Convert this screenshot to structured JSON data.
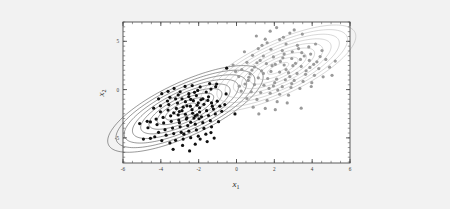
{
  "figure": {
    "background_color": "#f2f2f2",
    "plot_background_color": "#ffffff",
    "frame_color": "#4a4a4a"
  },
  "chart_data": {
    "type": "scatter",
    "title": "",
    "subtitle": "",
    "xlabel": "x",
    "xlabel_sub": "1",
    "ylabel": "x",
    "ylabel_sub": "2",
    "xlim": [
      -6,
      6
    ],
    "ylim": [
      -7.6,
      7.0
    ],
    "xticks": [
      -6,
      -4,
      -2,
      0,
      2,
      4,
      6
    ],
    "xtick_labels": [
      "-6",
      "-4",
      "-2",
      "0",
      "2",
      "4",
      "6"
    ],
    "yticks": [
      -5,
      0,
      5
    ],
    "ytick_labels": [
      "-5",
      "0",
      "5"
    ],
    "x_minor_tick_step": 0.5,
    "y_minor_tick_step": 0.5,
    "grid": false,
    "legend": "none",
    "series": [
      {
        "name": "cluster-1",
        "color": "#101010",
        "marker": "dot",
        "marker_size": 1.6,
        "mean": [
          -2.7,
          -2.0
        ],
        "cov": [
          [
            1.55,
            1.25
          ],
          [
            1.25,
            1.85
          ]
        ],
        "n_points": 120,
        "contour_levels": [
          0.45,
          0.85,
          1.2,
          1.55,
          1.9,
          2.25,
          2.6,
          2.95,
          3.3
        ],
        "contour_color": "#1d1d1d",
        "points": [
          [
            -2.72,
            0.33
          ],
          [
            -3.3,
            0.12
          ],
          [
            -3.62,
            -0.18
          ],
          [
            -2.34,
            0.42
          ],
          [
            -1.92,
            0.28
          ],
          [
            -2.05,
            -0.08
          ],
          [
            -3.95,
            -0.42
          ],
          [
            -4.12,
            -0.95
          ],
          [
            -3.52,
            -0.8
          ],
          [
            -3.08,
            -0.55
          ],
          [
            -2.52,
            -0.42
          ],
          [
            -2.12,
            -0.62
          ],
          [
            -1.6,
            -0.25
          ],
          [
            -1.35,
            0.05
          ],
          [
            -1.1,
            0.3
          ],
          [
            -1.48,
            -0.75
          ],
          [
            -1.88,
            -1.05
          ],
          [
            -2.28,
            -1.15
          ],
          [
            -2.7,
            -1.25
          ],
          [
            -3.12,
            -1.4
          ],
          [
            -3.58,
            -1.55
          ],
          [
            -4.02,
            -1.68
          ],
          [
            -4.38,
            -1.92
          ],
          [
            -4.02,
            -2.3
          ],
          [
            -3.62,
            -2.12
          ],
          [
            -3.18,
            -1.95
          ],
          [
            -2.82,
            -1.82
          ],
          [
            -2.44,
            -1.72
          ],
          [
            -2.08,
            -1.62
          ],
          [
            -1.72,
            -1.52
          ],
          [
            -1.32,
            -1.38
          ],
          [
            -1.02,
            -1.2
          ],
          [
            -0.88,
            -1.72
          ],
          [
            -1.22,
            -2.02
          ],
          [
            -1.58,
            -2.18
          ],
          [
            -1.95,
            -2.32
          ],
          [
            -2.32,
            -2.45
          ],
          [
            -2.7,
            -2.55
          ],
          [
            -3.08,
            -2.62
          ],
          [
            -3.48,
            -2.72
          ],
          [
            -3.88,
            -2.88
          ],
          [
            -4.25,
            -3.05
          ],
          [
            -4.55,
            -3.35
          ],
          [
            -4.2,
            -3.62
          ],
          [
            -3.85,
            -3.45
          ],
          [
            -3.45,
            -3.28
          ],
          [
            -3.05,
            -3.15
          ],
          [
            -2.65,
            -3.05
          ],
          [
            -2.25,
            -2.95
          ],
          [
            -1.85,
            -2.82
          ],
          [
            -1.48,
            -2.68
          ],
          [
            -1.12,
            -2.52
          ],
          [
            -1.38,
            -3.22
          ],
          [
            -1.78,
            -3.42
          ],
          [
            -2.18,
            -3.58
          ],
          [
            -2.58,
            -3.72
          ],
          [
            -2.98,
            -3.85
          ],
          [
            -3.38,
            -3.98
          ],
          [
            -3.78,
            -4.15
          ],
          [
            -4.12,
            -4.42
          ],
          [
            -3.72,
            -4.72
          ],
          [
            -3.32,
            -4.55
          ],
          [
            -2.92,
            -4.42
          ],
          [
            -2.52,
            -4.3
          ],
          [
            -2.12,
            -4.18
          ],
          [
            -1.72,
            -4.02
          ],
          [
            -1.32,
            -3.85
          ],
          [
            -1.62,
            -4.62
          ],
          [
            -2.02,
            -4.82
          ],
          [
            -2.42,
            -4.98
          ],
          [
            -2.82,
            -5.12
          ],
          [
            -3.22,
            -5.25
          ],
          [
            -1.18,
            -5.02
          ],
          [
            -1.55,
            -5.38
          ],
          [
            -2.18,
            -5.65
          ],
          [
            -2.85,
            -5.78
          ],
          [
            -3.52,
            -5.52
          ],
          [
            -2.48,
            -6.35
          ],
          [
            -3.35,
            -6.18
          ],
          [
            -4.55,
            -5.05
          ],
          [
            -4.92,
            -5.12
          ],
          [
            -4.68,
            -3.95
          ],
          [
            -5.12,
            -3.52
          ],
          [
            -4.72,
            -3.28
          ],
          [
            -0.95,
            -3.32
          ],
          [
            -0.78,
            -2.25
          ],
          [
            -0.62,
            -1.55
          ],
          [
            -0.55,
            -0.45
          ],
          [
            -1.05,
            0.58
          ],
          [
            -1.42,
            0.62
          ],
          [
            -2.88,
            -0.95
          ],
          [
            -2.42,
            -1.02
          ],
          [
            -2.02,
            -1.38
          ],
          [
            -2.62,
            -1.68
          ],
          [
            -3.02,
            -2.28
          ],
          [
            -2.35,
            -2.08
          ],
          [
            -1.95,
            -1.88
          ],
          [
            -2.88,
            -2.18
          ],
          [
            -3.32,
            -2.42
          ],
          [
            -2.18,
            -2.72
          ],
          [
            -2.62,
            -2.92
          ],
          [
            -3.02,
            -3.42
          ],
          [
            -2.42,
            -3.38
          ],
          [
            -1.98,
            -3.02
          ],
          [
            -3.65,
            -1.18
          ],
          [
            -3.22,
            -0.95
          ],
          [
            -2.52,
            -0.72
          ],
          [
            -1.78,
            -0.95
          ],
          [
            -1.28,
            -1.72
          ],
          [
            -1.52,
            -1.12
          ],
          [
            -2.22,
            -0.28
          ],
          [
            -2.98,
            -0.22
          ],
          [
            -2.08,
            -2.62
          ],
          [
            -2.78,
            -4.62
          ],
          [
            -1.92,
            -5.12
          ],
          [
            -1.35,
            -4.45
          ],
          [
            -0.52,
            2.22
          ],
          [
            -0.08,
            -2.52
          ],
          [
            -3.95,
            -5.28
          ],
          [
            -4.32,
            -4.88
          ]
        ]
      },
      {
        "name": "cluster-2",
        "color": "#9a9a9a",
        "marker": "dot",
        "marker_size": 1.6,
        "mean": [
          2.2,
          2.2
        ],
        "cov": [
          [
            1.55,
            1.25
          ],
          [
            1.25,
            1.85
          ]
        ],
        "n_points": 110,
        "contour_levels": [
          0.45,
          0.85,
          1.2,
          1.55,
          1.9,
          2.25,
          2.6,
          2.95,
          3.3
        ],
        "contour_color": "#a8a8a8",
        "points": [
          [
            1.78,
            6.05
          ],
          [
            2.82,
            5.85
          ],
          [
            3.48,
            5.75
          ],
          [
            2.28,
            5.18
          ],
          [
            1.62,
            4.85
          ],
          [
            2.62,
            4.72
          ],
          [
            3.22,
            4.58
          ],
          [
            3.82,
            4.42
          ],
          [
            1.15,
            4.25
          ],
          [
            1.82,
            4.18
          ],
          [
            2.42,
            4.05
          ],
          [
            2.95,
            3.92
          ],
          [
            3.45,
            3.82
          ],
          [
            3.92,
            3.68
          ],
          [
            0.85,
            3.55
          ],
          [
            1.42,
            3.48
          ],
          [
            1.95,
            3.38
          ],
          [
            2.45,
            3.3
          ],
          [
            2.92,
            3.22
          ],
          [
            3.38,
            3.12
          ],
          [
            3.85,
            3.02
          ],
          [
            4.25,
            2.88
          ],
          [
            0.55,
            2.82
          ],
          [
            1.08,
            2.78
          ],
          [
            1.58,
            2.7
          ],
          [
            2.05,
            2.62
          ],
          [
            2.52,
            2.55
          ],
          [
            2.98,
            2.48
          ],
          [
            3.42,
            2.4
          ],
          [
            3.88,
            2.3
          ],
          [
            4.35,
            2.18
          ],
          [
            0.28,
            2.08
          ],
          [
            0.82,
            2.02
          ],
          [
            1.32,
            1.95
          ],
          [
            1.82,
            1.88
          ],
          [
            2.28,
            1.82
          ],
          [
            2.75,
            1.75
          ],
          [
            3.2,
            1.68
          ],
          [
            3.65,
            1.58
          ],
          [
            4.12,
            1.48
          ],
          [
            4.58,
            1.32
          ],
          [
            0.12,
            1.35
          ],
          [
            0.65,
            1.28
          ],
          [
            1.15,
            1.22
          ],
          [
            1.65,
            1.15
          ],
          [
            2.12,
            1.08
          ],
          [
            2.58,
            1.02
          ],
          [
            3.05,
            0.95
          ],
          [
            3.52,
            0.85
          ],
          [
            3.98,
            0.72
          ],
          [
            0.45,
            0.58
          ],
          [
            0.95,
            0.52
          ],
          [
            1.45,
            0.45
          ],
          [
            1.95,
            0.38
          ],
          [
            2.42,
            0.3
          ],
          [
            2.88,
            0.22
          ],
          [
            3.35,
            0.12
          ],
          [
            0.25,
            -0.15
          ],
          [
            0.78,
            -0.22
          ],
          [
            1.28,
            -0.3
          ],
          [
            1.78,
            -0.38
          ],
          [
            2.28,
            -0.48
          ],
          [
            2.75,
            -0.58
          ],
          [
            0.55,
            -0.92
          ],
          [
            1.08,
            -1.02
          ],
          [
            1.62,
            -1.12
          ],
          [
            2.15,
            -1.25
          ],
          [
            2.68,
            -1.38
          ],
          [
            0.88,
            -1.82
          ],
          [
            1.52,
            -1.95
          ],
          [
            3.42,
            -1.92
          ],
          [
            2.12,
            6.42
          ],
          [
            4.92,
            2.32
          ],
          [
            5.05,
            1.48
          ],
          [
            4.72,
            3.12
          ],
          [
            1.05,
            5.55
          ],
          [
            3.05,
            6.18
          ],
          [
            0.42,
            3.92
          ],
          [
            4.52,
            4.05
          ],
          [
            2.62,
            2.08
          ],
          [
            1.88,
            2.48
          ],
          [
            2.32,
            2.92
          ],
          [
            1.42,
            1.68
          ],
          [
            2.82,
            1.35
          ],
          [
            3.12,
            2.72
          ],
          [
            1.25,
            3.02
          ],
          [
            2.02,
            0.72
          ],
          [
            3.68,
            1.95
          ],
          [
            0.72,
            1.62
          ],
          [
            2.52,
            3.68
          ],
          [
            3.28,
            4.25
          ],
          [
            1.72,
            0.12
          ],
          [
            2.92,
            0.62
          ],
          [
            0.95,
            2.35
          ],
          [
            4.08,
            2.62
          ],
          [
            1.35,
            4.58
          ],
          [
            2.18,
            -0.05
          ],
          [
            3.58,
            3.48
          ],
          [
            0.62,
            0.95
          ],
          [
            4.42,
            3.42
          ],
          [
            1.52,
            5.22
          ],
          [
            2.48,
            5.42
          ],
          [
            -0.05,
            1.88
          ],
          [
            -0.18,
            2.55
          ],
          [
            0.15,
            0.35
          ],
          [
            3.95,
            0.32
          ],
          [
            4.18,
            4.72
          ],
          [
            2.05,
            -2.08
          ],
          [
            1.18,
            -2.52
          ],
          [
            5.22,
            2.95
          ]
        ]
      }
    ]
  }
}
